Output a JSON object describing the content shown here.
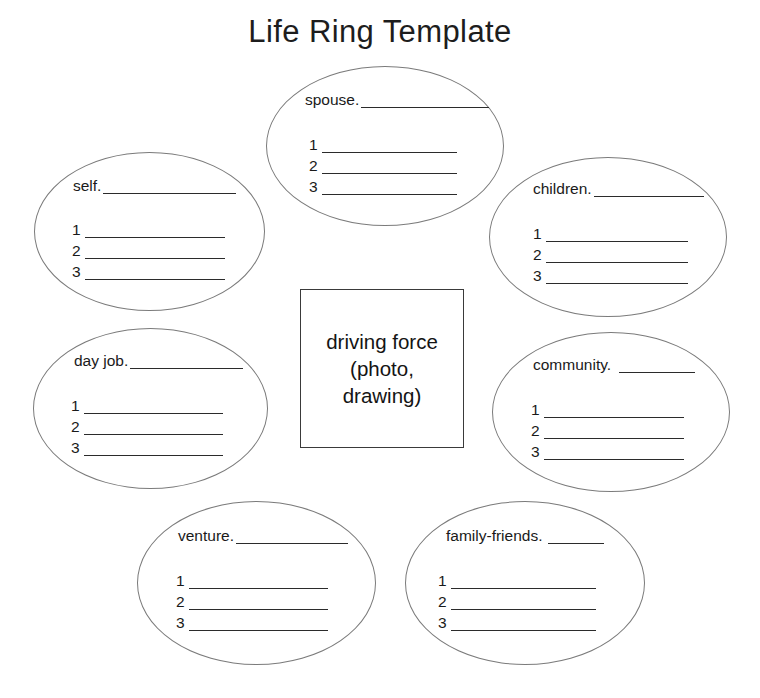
{
  "page": {
    "title": "Life Ring Template",
    "background_color": "#ffffff",
    "ink_color": "#1a1a1a",
    "ring_stroke_color": "#7b7b7b",
    "line_color": "#2b2b2b"
  },
  "center": {
    "text": "driving force\n(photo,\ndrawing)",
    "border_color": "#3a3a3a"
  },
  "rings": [
    {
      "id": "spouse",
      "label": "spouse.",
      "position": "top",
      "items": [
        "1",
        "2",
        "3"
      ],
      "blank_width": 128
    },
    {
      "id": "self",
      "label": "self.",
      "position": "top-left",
      "items": [
        "1",
        "2",
        "3"
      ],
      "blank_width": 133
    },
    {
      "id": "children",
      "label": "children.",
      "position": "top-right",
      "items": [
        "1",
        "2",
        "3"
      ],
      "blank_width": 110
    },
    {
      "id": "day-job",
      "label": "day job.",
      "position": "middle-left",
      "items": [
        "1",
        "2",
        "3"
      ],
      "blank_width": 113
    },
    {
      "id": "community",
      "label": "community.",
      "position": "middle-right",
      "items": [
        "1",
        "2",
        "3"
      ],
      "blank_width": 76
    },
    {
      "id": "venture",
      "label": "venture.",
      "position": "bottom-left",
      "items": [
        "1",
        "2",
        "3"
      ],
      "blank_width": 112
    },
    {
      "id": "family-friends",
      "label": "family-friends.",
      "position": "bottom-right",
      "items": [
        "1",
        "2",
        "3"
      ],
      "blank_width": 56
    }
  ]
}
